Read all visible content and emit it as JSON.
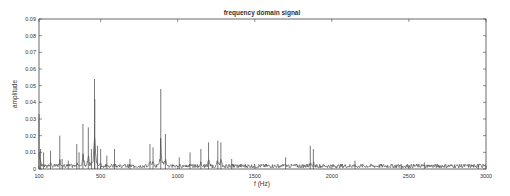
{
  "chart_data": {
    "type": "line",
    "title": "frequency domain signal",
    "xlabel": "f (Hz)",
    "ylabel": "amplitude",
    "xlim": [
      100,
      3000
    ],
    "ylim": [
      0,
      0.09
    ],
    "xticks": [
      100,
      500,
      1000,
      1500,
      2000,
      2500,
      3000
    ],
    "xtick_labels": [
      "100",
      "500",
      "1000",
      "1500",
      "2000",
      "2500",
      "3000"
    ],
    "yticks": [
      0,
      0.01,
      0.02,
      0.03,
      0.04,
      0.05,
      0.06,
      0.07,
      0.08,
      0.09
    ],
    "ytick_labels": [
      "0",
      "0.01",
      "0.02",
      "0.03",
      "0.04",
      "0.05",
      "0.06",
      "0.07",
      "0.08",
      "0.09"
    ],
    "grid": false,
    "legend": null,
    "color": "#555555",
    "series": [
      {
        "name": "spectrum",
        "peaks": [
          {
            "f": 100,
            "a": 0.033
          },
          {
            "f": 110,
            "a": 0.012
          },
          {
            "f": 130,
            "a": 0.01
          },
          {
            "f": 175,
            "a": 0.011
          },
          {
            "f": 235,
            "a": 0.02
          },
          {
            "f": 250,
            "a": 0.006
          },
          {
            "f": 290,
            "a": 0.005
          },
          {
            "f": 345,
            "a": 0.015
          },
          {
            "f": 360,
            "a": 0.01
          },
          {
            "f": 385,
            "a": 0.027
          },
          {
            "f": 420,
            "a": 0.025
          },
          {
            "f": 440,
            "a": 0.012
          },
          {
            "f": 460,
            "a": 0.054
          },
          {
            "f": 462,
            "a": 0.042
          },
          {
            "f": 480,
            "a": 0.014
          },
          {
            "f": 500,
            "a": 0.012
          },
          {
            "f": 540,
            "a": 0.008
          },
          {
            "f": 590,
            "a": 0.012
          },
          {
            "f": 690,
            "a": 0.006
          },
          {
            "f": 820,
            "a": 0.015
          },
          {
            "f": 840,
            "a": 0.013
          },
          {
            "f": 890,
            "a": 0.048
          },
          {
            "f": 920,
            "a": 0.021
          },
          {
            "f": 1010,
            "a": 0.007
          },
          {
            "f": 1080,
            "a": 0.01
          },
          {
            "f": 1150,
            "a": 0.012
          },
          {
            "f": 1200,
            "a": 0.016
          },
          {
            "f": 1260,
            "a": 0.017
          },
          {
            "f": 1280,
            "a": 0.016
          },
          {
            "f": 1350,
            "a": 0.006
          },
          {
            "f": 1700,
            "a": 0.007
          },
          {
            "f": 1860,
            "a": 0.014
          },
          {
            "f": 1880,
            "a": 0.012
          },
          {
            "f": 2150,
            "a": 0.005
          },
          {
            "f": 2450,
            "a": 0.003
          },
          {
            "f": 2600,
            "a": 0.004
          },
          {
            "f": 2950,
            "a": 0.003
          }
        ],
        "noise_floor": 0.002
      }
    ]
  }
}
